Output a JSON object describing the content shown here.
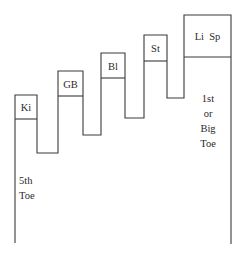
{
  "diagram": {
    "type": "foot-meridian-step-diagram",
    "boxes": [
      {
        "id": "ki",
        "label": "Ki"
      },
      {
        "id": "gb",
        "label": "GB"
      },
      {
        "id": "bl",
        "label": "Bl"
      },
      {
        "id": "st",
        "label": "St"
      },
      {
        "id": "lisp",
        "label": "Li  Sp"
      }
    ],
    "left_label": {
      "line1": "5th",
      "line2": "Toe"
    },
    "right_label": {
      "line1": "1st",
      "line2": "or",
      "line3": "Big",
      "line4": "Toe"
    },
    "colors": {
      "line": "#3a3a3a",
      "text": "#2a2a2a",
      "background": "#ffffff"
    }
  }
}
